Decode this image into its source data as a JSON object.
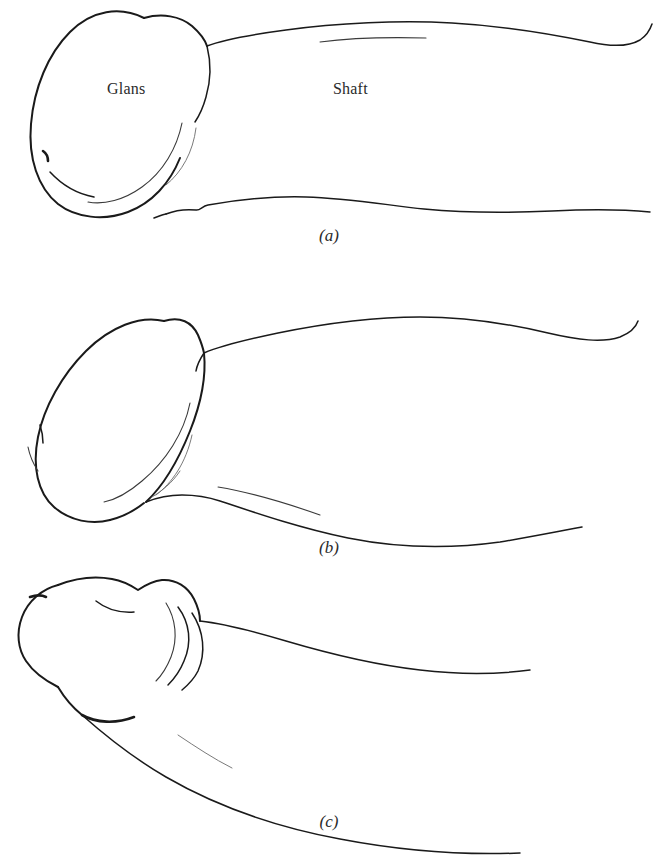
{
  "figure": {
    "type": "anatomical-line-drawing",
    "title": "",
    "background_color": "#ffffff",
    "ink_color": "#1a1a1a",
    "panel_count": 3,
    "labels": [
      {
        "id": "glans",
        "text": "Glans",
        "panel": "a"
      },
      {
        "id": "shaft",
        "text": "Shaft",
        "panel": "a"
      }
    ],
    "panels": [
      {
        "id": "a",
        "caption": "(a)",
        "description": "Side view with rounded oval glans and straight horizontal shaft",
        "labels": [
          "Glans",
          "Shaft"
        ]
      },
      {
        "id": "b",
        "caption": "(b)",
        "description": "Side view with teardrop glans angled downward and tapering shaft",
        "labels": []
      },
      {
        "id": "c",
        "caption": "(c)",
        "description": "Side view with retracted head, foreskin folds and downward curving shaft",
        "labels": []
      }
    ]
  }
}
